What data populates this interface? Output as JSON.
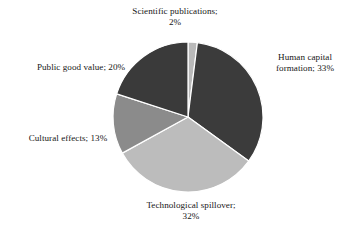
{
  "chart_data": {
    "type": "pie",
    "title": "",
    "subtitle": "",
    "xlabel": "",
    "ylabel": "",
    "legend_position": "none",
    "grid": false,
    "label_format": "category; value%",
    "label_separator": ";",
    "units": "%",
    "total": 100,
    "start_angle_deg": 0,
    "direction": "clockwise",
    "categories": [
      "Scientific publications",
      "Human capital formation",
      "Technological spillover",
      "Cultural effects",
      "Public good value"
    ],
    "values": [
      2,
      33,
      32,
      13,
      20
    ],
    "colors": [
      "#b9b9b9",
      "#3b3b3b",
      "#bcbcbc",
      "#8b8b8b",
      "#3a3a3a"
    ],
    "slices": [
      {
        "name": "Scientific publications",
        "value": 2,
        "value_label": "2%",
        "color": "#b9b9b9",
        "start_angle_deg": 0,
        "end_angle_deg": 7.2,
        "label_lines": [
          "Scientific publications;",
          "2%"
        ],
        "label_position": "top"
      },
      {
        "name": "Human capital formation",
        "value": 33,
        "value_label": "33%",
        "color": "#3b3b3b",
        "start_angle_deg": 7.2,
        "end_angle_deg": 126.0,
        "label_lines": [
          "Human capital",
          "formation; 33%"
        ],
        "label_position": "right"
      },
      {
        "name": "Technological spillover",
        "value": 32,
        "value_label": "32%",
        "color": "#bcbcbc",
        "start_angle_deg": 126.0,
        "end_angle_deg": 241.2,
        "label_lines": [
          "Technological spillover;",
          "32%"
        ],
        "label_position": "bottom"
      },
      {
        "name": "Cultural effects",
        "value": 13,
        "value_label": "13%",
        "color": "#8b8b8b",
        "start_angle_deg": 241.2,
        "end_angle_deg": 288.0,
        "label_lines": [
          "Cultural effects; 13%"
        ],
        "label_position": "left"
      },
      {
        "name": "Public good value",
        "value": 20,
        "value_label": "20%",
        "color": "#3a3a3a",
        "start_angle_deg": 288.0,
        "end_angle_deg": 360.0,
        "label_lines": [
          "Public good value; 20%"
        ],
        "label_position": "upper-left"
      }
    ]
  },
  "labels": {
    "scientific_publications": {
      "line1": "Scientific publications;",
      "line2": "2%"
    },
    "human_capital_formation": {
      "line1": "Human capital",
      "line2": "formation; 33%"
    },
    "technological_spillover": {
      "line1": "Technological spillover;",
      "line2": "32%"
    },
    "cultural_effects": {
      "line1": "Cultural effects; 13%"
    },
    "public_good_value": {
      "line1": "Public good value; 20%"
    }
  },
  "geometry": {
    "center_x": 188,
    "center_y": 117,
    "radius": 75,
    "separator_color": "#ffffff",
    "separator_width": 1.2,
    "background": "#ffffff"
  }
}
